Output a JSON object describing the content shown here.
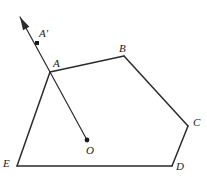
{
  "figure": {
    "type": "geometry-diagram",
    "width": 207,
    "height": 177,
    "background_color": "#ffffff",
    "stroke_color": "#2b2b2b",
    "label_color": "#1a1a1a"
  },
  "points": {
    "A": {
      "label": "A",
      "x": 50,
      "y": 72
    },
    "Ap": {
      "label": "A'",
      "x": 37,
      "y": 43
    },
    "B": {
      "label": "B",
      "x": 124,
      "y": 56
    },
    "C": {
      "label": "C",
      "x": 188,
      "y": 126
    },
    "D": {
      "label": "D",
      "x": 172,
      "y": 166
    },
    "E": {
      "label": "E",
      "x": 17,
      "y": 166
    },
    "O": {
      "label": "O",
      "x": 87,
      "y": 140
    }
  },
  "arrow_tip": {
    "x": 20,
    "y": 17
  },
  "edges": [
    {
      "name": "edge-AB",
      "from": "A",
      "to": "B"
    },
    {
      "name": "edge-BC",
      "from": "B",
      "to": "C"
    },
    {
      "name": "edge-CD",
      "from": "C",
      "to": "D"
    },
    {
      "name": "edge-DE",
      "from": "D",
      "to": "E"
    },
    {
      "name": "edge-EA",
      "from": "E",
      "to": "A"
    },
    {
      "name": "segment-AO",
      "from": "A",
      "to": "O"
    }
  ],
  "ray": {
    "name": "ray-A-to-Aprime",
    "from": "A",
    "through": "Ap",
    "to": "arrow_tip",
    "has_arrowhead": true
  },
  "markers": [
    {
      "name": "point-marker-Aprime",
      "at": "Ap",
      "style": "filled-square"
    },
    {
      "name": "point-marker-O",
      "at": "O",
      "style": "filled-dot"
    }
  ]
}
